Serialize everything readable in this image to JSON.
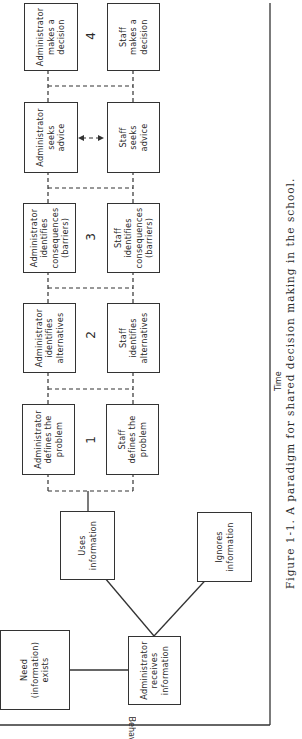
{
  "diagram": {
    "axes": {
      "y_label": "Behavior",
      "x_label": "Time"
    },
    "nodes": {
      "need": "Need\n(information)\nexists",
      "admin_receives": "Administrator\nreceives\ninformation",
      "uses": "Uses\ninformation",
      "ignores": "Ignores\ninformation",
      "admin_defines": "Administrator\ndefines the\nproblem",
      "staff_defines": "Staff\ndefines the\nproblem",
      "admin_alternatives": "Administrator\nidentifies\nalternatives",
      "staff_alternatives": "Staff\nidentifies\nalternatives",
      "admin_consequences": "Administrator\nidentifies\nconsequences\n(barriers)",
      "staff_consequences": "Staff\nidentifies\nconsequences\n(barriers)",
      "admin_seeks": "Administrator\nseeks\nadvice",
      "staff_seeks": "Staff\nseeks\nadvice",
      "admin_decision": "Administrator\nmakes a\ndecision",
      "staff_decision": "Staff\nmakes a\ndecision"
    },
    "stages": [
      "1",
      "2",
      "3",
      "4"
    ],
    "caption": "Figure 1-1. A paradigm for shared decision making in the school."
  }
}
